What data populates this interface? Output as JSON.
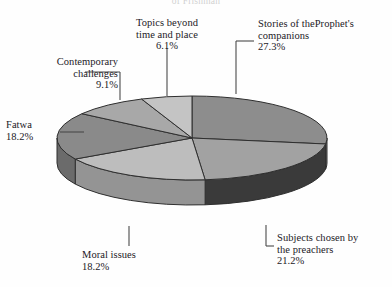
{
  "chart_data": {
    "type": "pie",
    "title": "of Frishman",
    "title_partial": true,
    "categories": [
      "Stories of theProphet's companions",
      "Subjects chosen by the preachers",
      "Moral issues",
      "Fatwa",
      "Contemporary challenges",
      "Topics beyond time and place"
    ],
    "values": [
      27.3,
      21.2,
      18.2,
      18.2,
      9.1,
      6.1
    ],
    "unit": "%",
    "xlabel": "",
    "ylabel": "",
    "legend": "none",
    "grid": false,
    "three_d": true,
    "start_angle_deg": -90,
    "direction": "clockwise",
    "slices": [
      {
        "label_line1": "Stories of theProphet's",
        "label_line2": "companions",
        "pct": "27.3%",
        "value": 27.3,
        "color": "#8d8d8d",
        "side_color": "#6e6e6e"
      },
      {
        "label_line1": "Subjects chosen by",
        "label_line2": "the preachers",
        "pct": "21.2%",
        "value": 21.2,
        "color": "#a2a2a2",
        "side_color": "#3a3a3a"
      },
      {
        "label_line1": "Moral issues",
        "label_line2": "",
        "pct": "18.2%",
        "value": 18.2,
        "color": "#bdbdbd",
        "side_color": "#949494"
      },
      {
        "label_line1": "Fatwa",
        "label_line2": "",
        "pct": "18.2%",
        "value": 18.2,
        "color": "#8a8a8a",
        "side_color": "#6b6b6b"
      },
      {
        "label_line1": "Contemporary",
        "label_line2": "challenges",
        "pct": "9.1%",
        "value": 9.1,
        "color": "#a8a8a8",
        "side_color": "#828282"
      },
      {
        "label_line1": "Topics beyond",
        "label_line2": "time and place",
        "pct": "6.1%",
        "value": 6.1,
        "color": "#c4c4c4",
        "side_color": "#9a9a9a"
      }
    ],
    "colors": {
      "background": "#fefefe",
      "outline": "#2f2f2f",
      "text": "#23201e",
      "leader": "#4a4a4a"
    },
    "geometry": {
      "cx": 192,
      "cy": 138,
      "rx": 135,
      "ry": 42,
      "depth": 25
    }
  }
}
